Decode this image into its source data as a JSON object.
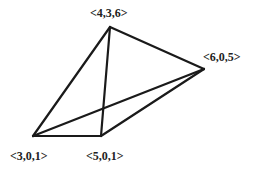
{
  "diagram": {
    "type": "tetrahedron",
    "vertices": [
      {
        "id": "A",
        "label": "<4,3,6>",
        "x": 110,
        "y": 27,
        "lx": 90,
        "ly": 17
      },
      {
        "id": "B",
        "label": "<6,0,5>",
        "x": 204,
        "y": 69,
        "lx": 203,
        "ly": 61
      },
      {
        "id": "C",
        "label": "<3,0,1>",
        "x": 33,
        "y": 136,
        "lx": 10,
        "ly": 160
      },
      {
        "id": "D",
        "label": "<5,0,1>",
        "x": 101,
        "y": 136,
        "lx": 86,
        "ly": 160
      }
    ],
    "edges": [
      [
        "A",
        "B"
      ],
      [
        "A",
        "C"
      ],
      [
        "A",
        "D"
      ],
      [
        "B",
        "C"
      ],
      [
        "B",
        "D"
      ],
      [
        "C",
        "D"
      ]
    ],
    "stroke_color": "#1a1a1a"
  }
}
